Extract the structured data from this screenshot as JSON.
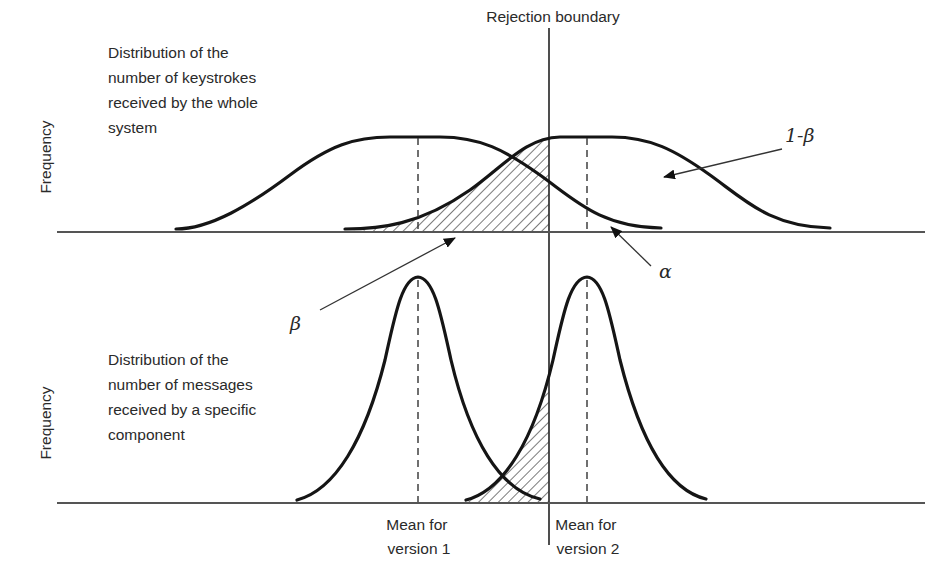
{
  "diagram": {
    "boundary_label": "Rejection boundary",
    "top_panel": {
      "y_axis_label": "Frequency",
      "description_lines": [
        "Distribution of the",
        "number of keystrokes",
        "received by the whole",
        "system"
      ],
      "curve_shape": "broad (high variance)"
    },
    "bottom_panel": {
      "y_axis_label": "Frequency",
      "description_lines": [
        "Distribution of the",
        "number of messages",
        "received by a specific",
        "component"
      ],
      "curve_shape": "narrow (low variance)"
    },
    "annotations": {
      "one_minus_beta": "1-β",
      "alpha": "α",
      "beta": "β"
    },
    "x_labels": {
      "mean_v1_line1": "Mean for",
      "mean_v1_line2": "version 1",
      "mean_v2_line1": "Mean for",
      "mean_v2_line2": "version 2"
    },
    "colors": {
      "curve": "#151515",
      "hatch": "#333333",
      "background": "#ffffff"
    }
  }
}
